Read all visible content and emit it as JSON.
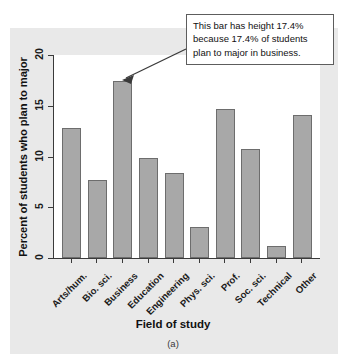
{
  "figure": {
    "caption": "(a)",
    "annotation": {
      "line1": "This bar has height 17.4%",
      "line2": "because 17.4% of students",
      "line3": "plan to major in business.",
      "target_category": "Business"
    },
    "colors": {
      "panel_background": "#e9e9e9",
      "plot_background": "#ffffff",
      "bar_fill": "#a8a8a8",
      "bar_border": "#6d6d6d",
      "axis": "#3a3a3a",
      "text": "#111111"
    }
  },
  "chart_data": {
    "type": "bar",
    "title": "",
    "xlabel": "Field of study",
    "ylabel": "Percent of students who plan to major",
    "categories": [
      "Arts/hum.",
      "Bio. sci.",
      "Business",
      "Education",
      "Engineering",
      "Phys. sci.",
      "Prof.",
      "Soc. sci.",
      "Technical",
      "Other"
    ],
    "values": [
      12.8,
      7.7,
      17.4,
      9.9,
      8.4,
      3.1,
      14.7,
      10.7,
      1.2,
      14.1
    ],
    "ylim": [
      0,
      20
    ],
    "yticks": [
      0,
      5,
      10,
      15,
      20
    ],
    "ytick_labels": [
      "0",
      "5",
      "10",
      "15",
      "20"
    ],
    "grid": false,
    "legend": false
  }
}
